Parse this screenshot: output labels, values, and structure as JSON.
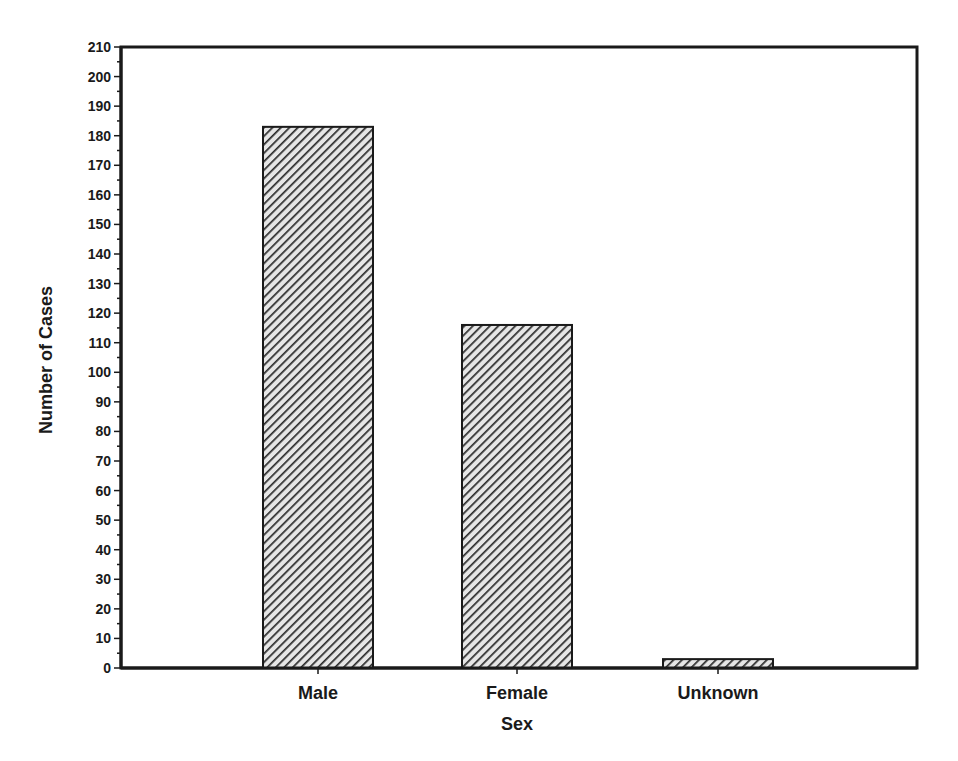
{
  "chart_data": {
    "type": "bar",
    "title": "",
    "xlabel": "Sex",
    "ylabel": "Number of Cases",
    "categories": [
      "Male",
      "Female",
      "Unknown"
    ],
    "values": [
      183,
      116,
      3
    ],
    "ylim": [
      0,
      210
    ],
    "y_major_step": 10,
    "y_minor_step": 5,
    "y_ticks": [
      0,
      10,
      20,
      30,
      40,
      50,
      60,
      70,
      80,
      90,
      100,
      110,
      120,
      130,
      140,
      150,
      160,
      170,
      180,
      190,
      200,
      210
    ],
    "grid": false,
    "legend": null,
    "bar_fill": "diagonal-hatch",
    "colors": {
      "bar_dark": "#2a2a2a",
      "bar_light": "#e8e8e8",
      "axis": "#1a1a1a",
      "background": "#ffffff"
    }
  }
}
